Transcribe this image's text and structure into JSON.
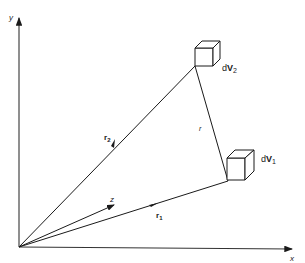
{
  "diagram": {
    "axes": {
      "x_label": "x",
      "y_label": "y",
      "z_label": "z"
    },
    "vectors": {
      "r1_label": "r",
      "r1_sub": "1",
      "r2_label": "r",
      "r2_sub": "2",
      "r_label": "r"
    },
    "volumes": {
      "dV1_prefix": "d",
      "dV1_main": "V",
      "dV1_sub": "1",
      "dV2_prefix": "d",
      "dV2_main": "V",
      "dV2_sub": "2"
    },
    "colors": {
      "line": "#1a1a1a",
      "axis": "#333333",
      "background": "#ffffff"
    }
  }
}
